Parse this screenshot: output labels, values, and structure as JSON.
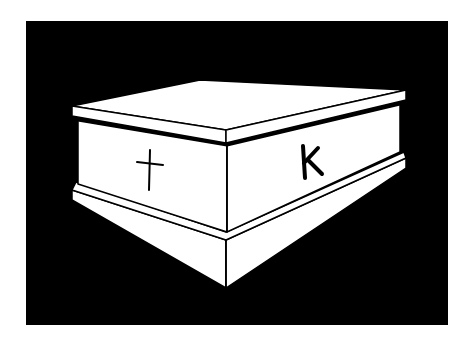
{
  "illustration": {
    "subject": "tomb",
    "background_color": "#000000",
    "foreground_color": "#ffffff",
    "line_color": "#000000",
    "left_face_symbol": "†",
    "right_face_letter": "K"
  }
}
